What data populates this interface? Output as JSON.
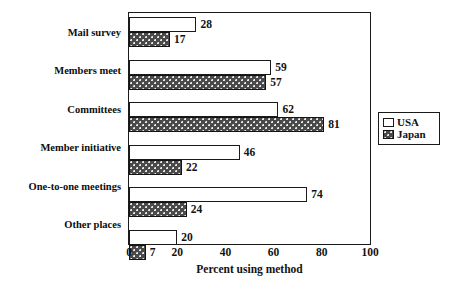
{
  "chart_data": {
    "type": "bar",
    "orientation": "horizontal",
    "title": "",
    "xlabel": "Percent using method",
    "ylabel": "",
    "xlim": [
      0,
      100
    ],
    "xticks": [
      0,
      20,
      40,
      60,
      80,
      100
    ],
    "grid": false,
    "legend_position": "right",
    "categories": [
      "Mail survey",
      "Members meet",
      "Committees",
      "Member initiative",
      "One-to-one meetings",
      "Other places"
    ],
    "series": [
      {
        "name": "USA",
        "color": "#ffffff",
        "values": [
          28,
          59,
          62,
          46,
          74,
          20
        ]
      },
      {
        "name": "Japan",
        "color": "#4a4a4a",
        "values": [
          17,
          57,
          81,
          22,
          24,
          7
        ]
      }
    ]
  },
  "legend": {
    "items": [
      {
        "label": "USA",
        "swatch": "usa"
      },
      {
        "label": "Japan",
        "swatch": "japan"
      }
    ]
  }
}
